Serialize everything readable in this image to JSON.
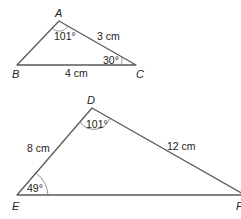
{
  "triangles": [
    {
      "name": "ABC",
      "vertices": {
        "A": "A",
        "B": "B",
        "C": "C"
      },
      "sides": {
        "AC": "3 cm",
        "BC": "4 cm"
      },
      "angles": {
        "A": "101°",
        "C": "30°"
      }
    },
    {
      "name": "DEF",
      "vertices": {
        "D": "D",
        "E": "E",
        "F": "F"
      },
      "sides": {
        "DE": "8 cm",
        "DF": "12 cm"
      },
      "angles": {
        "D": "101°",
        "E": "49°"
      }
    }
  ],
  "colors": {
    "lines": "#5a5a5a",
    "text": "#222222",
    "background": "#ffffff"
  }
}
